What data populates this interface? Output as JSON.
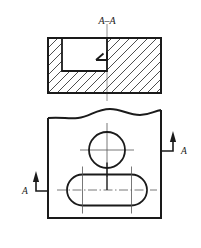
{
  "drawing": {
    "title_label": "A–A",
    "section_letter_left": "A",
    "section_letter_right": "A",
    "background_color": "#ffffff",
    "line_color": "#1a1a1a",
    "hatch_color": "#3a3a3a",
    "thin_line_color": "#555555"
  },
  "views": {
    "section_view": {
      "name": "A-A",
      "outline": {
        "x": 48,
        "y": 38,
        "width": 113,
        "height": 55
      },
      "cavity": {
        "x": 62,
        "y": 38,
        "width": 45,
        "height": 33
      },
      "centerline_x": 107,
      "hatch_angle_deg": 45,
      "hatch_spacing": 9
    },
    "plan_view": {
      "outline": {
        "x": 48,
        "y": 113,
        "width": 113,
        "height": 105
      },
      "break_line_top": true,
      "hole": {
        "cx": 107,
        "cy": 150,
        "r": 18
      },
      "slot": {
        "cx": 107,
        "cy": 190,
        "length": 80,
        "height": 31
      }
    }
  },
  "annotations": {
    "arrow_left": {
      "letter": "A",
      "direction": "up",
      "tip_x": 36,
      "tip_y": 171,
      "base_y": 191,
      "elbow_x": 49
    },
    "arrow_right": {
      "letter": "A",
      "direction": "up",
      "tip_x": 173,
      "tip_y": 131,
      "base_y": 151,
      "elbow_x": 160
    }
  }
}
